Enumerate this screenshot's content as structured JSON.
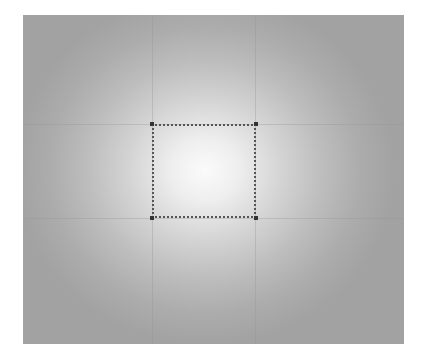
{
  "canvas": {
    "background": {
      "type": "radial-gradient",
      "center_color": "#fbfbfb",
      "edge_color": "#a2a2a2"
    },
    "selection": {
      "style": "dotted",
      "border_color": "#555555",
      "x": 152,
      "y": 124,
      "width": 104,
      "height": 94
    },
    "guides": {
      "horizontal_y": [
        124,
        218
      ],
      "vertical_x": [
        152,
        256
      ]
    }
  }
}
